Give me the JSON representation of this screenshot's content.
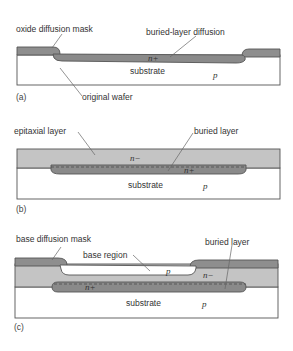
{
  "colors": {
    "oxide": "#8e8e8e",
    "nplus": "#8a8a8a",
    "nminus": "#c4c4c4",
    "substrate": "#ffffff",
    "outline": "#555555"
  },
  "panels": [
    {
      "id": "a",
      "panel_label": "(a)",
      "labels": {
        "oxide_mask": "oxide diffusion mask",
        "buried_diffusion": "buried-layer diffusion",
        "nplus": "n+",
        "substrate": "substrate",
        "p": "p",
        "original_wafer": "original wafer"
      }
    },
    {
      "id": "b",
      "panel_label": "(b)",
      "labels": {
        "epitaxial": "epitaxial layer",
        "buried": "buried layer",
        "nminus": "n−",
        "nplus": "n+",
        "substrate": "substrate",
        "p": "p"
      }
    },
    {
      "id": "c",
      "panel_label": "(c)",
      "labels": {
        "base_mask": "base diffusion mask",
        "base_region": "base region",
        "buried": "buried layer",
        "p_base": "p",
        "nminus": "n−",
        "nplus": "n+",
        "substrate": "substrate",
        "p": "p"
      }
    }
  ]
}
